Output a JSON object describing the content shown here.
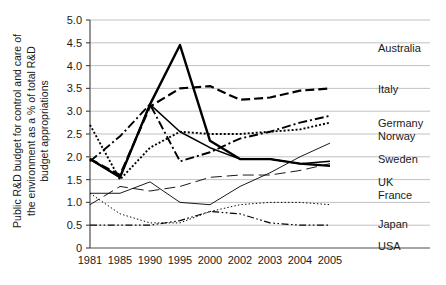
{
  "figure": {
    "width": 446,
    "height": 285,
    "background": "#ffffff"
  },
  "axis": {
    "ylabel": "Public R&D budget for control and care of the environment as a % of total R&D budget appropriations",
    "ylabel_line1": "Public R&D budget for control and care of",
    "ylabel_line2": "the environment as a % of total R&D",
    "ylabel_line3": "budget appropriations",
    "xlabel": "",
    "ytick_labels": [
      "5.0",
      "4.5",
      "4.0",
      "3.5",
      "3.0",
      "2.5",
      "2.0",
      "1.5",
      "1.0",
      "0.5",
      "0"
    ],
    "xtick_labels": [
      "1981",
      "1985",
      "1990",
      "1995",
      "2000",
      "2002",
      "2003",
      "2004",
      "2005"
    ],
    "gridline_color": "#b3b3b3",
    "axis_color": "#4d4d4d"
  },
  "chart_data": {
    "type": "line",
    "title": "",
    "subtitle": "",
    "xlabel": "",
    "ylabel": "Public R&D budget for control and care of the environment as a % of total R&D budget appropriations",
    "categories": [
      "1981",
      "1985",
      "1990",
      "1995",
      "2000",
      "2002",
      "2003",
      "2004",
      "2005"
    ],
    "x": [
      1981,
      1985,
      1990,
      1995,
      2000,
      2002,
      2003,
      2004,
      2005
    ],
    "ylim": [
      0,
      5.0
    ],
    "ytick_step": 0.5,
    "grid": true,
    "legend_position": "right",
    "series": [
      {
        "name": "Australia",
        "values": [
          1.95,
          1.55,
          3.15,
          4.45,
          2.35,
          1.95,
          1.95,
          1.85,
          1.8
        ],
        "style": "solid",
        "width": 2.4,
        "color": "#000000"
      },
      {
        "name": "Italy",
        "values": [
          1.95,
          1.6,
          3.1,
          3.5,
          3.55,
          3.25,
          3.3,
          3.45,
          3.5
        ],
        "style": "dashed",
        "width": 2.2,
        "color": "#000000"
      },
      {
        "name": "Germany",
        "values": [
          1.9,
          2.45,
          3.15,
          1.9,
          2.1,
          2.4,
          2.55,
          2.75,
          2.9
        ],
        "style": "dashdot",
        "width": 1.9,
        "color": "#000000"
      },
      {
        "name": "Norway",
        "values": [
          2.7,
          1.5,
          2.2,
          2.55,
          2.5,
          2.5,
          2.55,
          2.6,
          2.75
        ],
        "style": "dotted",
        "width": 1.9,
        "color": "#000000"
      },
      {
        "name": "Sweden",
        "values": [
          1.2,
          1.2,
          1.45,
          1.0,
          0.95,
          1.35,
          1.65,
          2.0,
          2.3
        ],
        "style": "solid",
        "width": 0.9,
        "color": "#000000"
      },
      {
        "name": "UK",
        "values": [
          1.95,
          1.55,
          3.15,
          2.55,
          2.2,
          1.95,
          1.95,
          1.85,
          1.9
        ],
        "style": "solid",
        "width": 1.5,
        "color": "#000000"
      },
      {
        "name": "France",
        "values": [
          0.95,
          1.35,
          1.25,
          1.35,
          1.55,
          1.6,
          1.6,
          1.7,
          1.85
        ],
        "style": "longdash",
        "width": 0.9,
        "color": "#000000"
      },
      {
        "name": "Japan",
        "values": [
          1.2,
          0.75,
          0.55,
          0.55,
          0.8,
          0.95,
          1.0,
          1.0,
          0.95
        ],
        "style": "finedot",
        "width": 1.0,
        "color": "#000000"
      },
      {
        "name": "USA",
        "values": [
          0.5,
          0.5,
          0.5,
          0.6,
          0.8,
          0.75,
          0.55,
          0.5,
          0.5
        ],
        "style": "dashdotdot",
        "width": 1.2,
        "color": "#000000"
      }
    ]
  },
  "legend": {
    "items": [
      {
        "label": "Australia",
        "y": 52
      },
      {
        "label": "Italy",
        "y": 93
      },
      {
        "label": "Germany",
        "y": 127
      },
      {
        "label": "Norway",
        "y": 140
      },
      {
        "label": "Sweden",
        "y": 163
      },
      {
        "label": "UK",
        "y": 186
      },
      {
        "label": "France",
        "y": 199
      },
      {
        "label": "Japan",
        "y": 228
      },
      {
        "label": "USA",
        "y": 250
      }
    ]
  }
}
